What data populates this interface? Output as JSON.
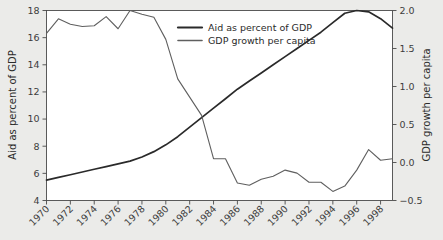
{
  "chart_data": {
    "type": "line",
    "title": "",
    "xlabel": "",
    "ylabel": "Aid as percent of GDP",
    "y2label": "GDP growth per capita",
    "xlim": [
      1970,
      1999
    ],
    "ylim": [
      4,
      18
    ],
    "y2lim": [
      -0.5,
      2.0
    ],
    "grid": false,
    "legend_position": "top-center",
    "xticks": [
      "1970",
      "1972",
      "1974",
      "1976",
      "1978",
      "1980",
      "1982",
      "1984",
      "1986",
      "1988",
      "1990",
      "1992",
      "1994",
      "1996",
      "1998"
    ],
    "xtick_values": [
      1970,
      1972,
      1974,
      1976,
      1978,
      1980,
      1982,
      1984,
      1986,
      1988,
      1990,
      1992,
      1994,
      1996,
      1998
    ],
    "yticks": [
      "4",
      "6",
      "8",
      "10",
      "12",
      "14",
      "16",
      "18"
    ],
    "ytick_values": [
      4,
      6,
      8,
      10,
      12,
      14,
      16,
      18
    ],
    "y2ticks": [
      "−0.5",
      "0.0",
      "0.5",
      "1.0",
      "1.5",
      "2.0"
    ],
    "y2tick_values": [
      -0.5,
      0.0,
      0.5,
      1.0,
      1.5,
      2.0
    ],
    "x": [
      1970,
      1971,
      1972,
      1973,
      1974,
      1975,
      1976,
      1977,
      1978,
      1979,
      1980,
      1981,
      1982,
      1983,
      1984,
      1985,
      1986,
      1987,
      1988,
      1989,
      1990,
      1991,
      1992,
      1993,
      1994,
      1995,
      1996,
      1997,
      1998,
      1999
    ],
    "series": [
      {
        "name": "Aid as percent of GDP",
        "axis": "left",
        "color": "#2a2a2a",
        "width": 1.7,
        "values": [
          5.5,
          5.7,
          5.9,
          6.1,
          6.3,
          6.5,
          6.7,
          6.9,
          7.2,
          7.6,
          8.1,
          8.7,
          9.4,
          10.1,
          10.8,
          11.5,
          12.2,
          12.8,
          13.4,
          14.0,
          14.6,
          15.2,
          15.8,
          16.4,
          17.1,
          17.8,
          18.0,
          17.9,
          17.4,
          16.7
        ]
      },
      {
        "name": "GDP growth per capita",
        "axis": "right",
        "color": "#5f5f5f",
        "width": 1.1,
        "values": [
          1.7,
          1.89,
          1.82,
          1.79,
          1.8,
          1.92,
          1.76,
          2.0,
          1.95,
          1.91,
          1.62,
          1.1,
          0.86,
          0.62,
          0.05,
          0.05,
          -0.27,
          -0.3,
          -0.22,
          -0.18,
          -0.1,
          -0.14,
          -0.26,
          -0.26,
          -0.38,
          -0.31,
          -0.1,
          0.17,
          0.03,
          0.05
        ]
      }
    ]
  },
  "legend": {
    "entries": [
      {
        "label": "Aid as percent of GDP",
        "color": "#2a2a2a",
        "width": 2.2
      },
      {
        "label": "GDP growth per capita",
        "color": "#5f5f5f",
        "width": 1.6
      }
    ]
  },
  "axes": {
    "left_title": "Aid as percent of GDP",
    "right_title": "GDP growth per capita"
  },
  "colors": {
    "background": "#ebebe9",
    "plot_background": "#ffffff",
    "frame": "#4a4a4a",
    "aid_line": "#2a2a2a",
    "growth_line": "#5f5f5f",
    "text": "#2b2b2b"
  }
}
